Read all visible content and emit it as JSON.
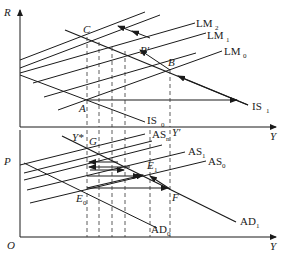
{
  "upper_panel": {
    "y_axis_label": "R",
    "x_axis_label": "Y",
    "curves": {
      "lm2": {
        "name": "LM",
        "sub": "2"
      },
      "lm1": {
        "name": "LM",
        "sub": "1"
      },
      "lm0": {
        "name": "LM",
        "sub": "0"
      },
      "is0": {
        "name": "IS",
        "sub": "0"
      },
      "is1": {
        "name": "IS",
        "sub": "1"
      }
    },
    "points": {
      "a": "A",
      "b": "B",
      "b_prime": "B′",
      "c": "C"
    }
  },
  "lower_panel": {
    "y_axis_label": "P",
    "x_axis_label": "Y",
    "origin_label": "O",
    "curves": {
      "asn": {
        "name": "AS",
        "sub": "n"
      },
      "as1": {
        "name": "AS",
        "sub": "1"
      },
      "as0": {
        "name": "AS",
        "sub": "0"
      },
      "ad0": {
        "name": "AD",
        "sub": "0"
      },
      "ad1": {
        "name": "AD",
        "sub": "1"
      }
    },
    "points": {
      "g": "G",
      "e1": "E",
      "e1_sub": "1",
      "e0": "E",
      "e0_sub": "0",
      "f": "F",
      "y_star": "Y*",
      "y_prime": "Y′"
    }
  },
  "colors": {
    "line": "#1a1a1a",
    "dash": "#333333"
  }
}
